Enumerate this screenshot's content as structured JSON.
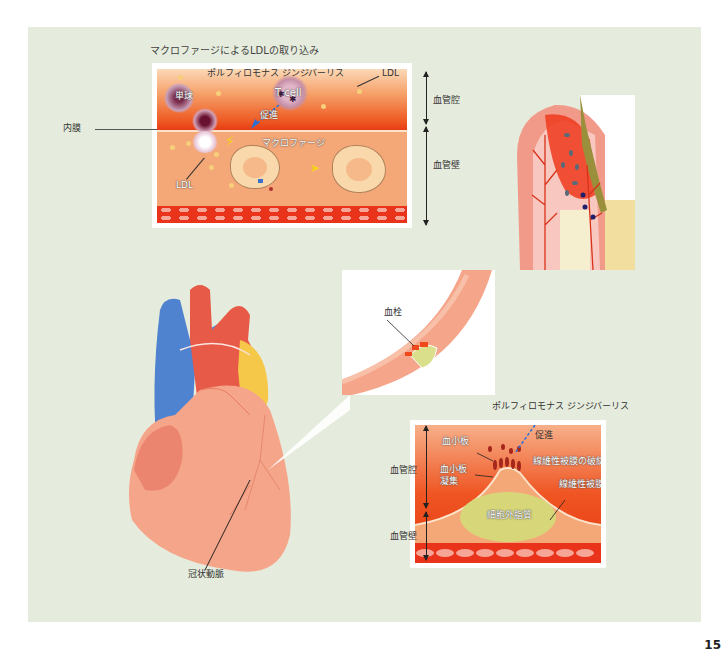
{
  "figure": {
    "background_color": "#e6ecdd",
    "top_panel": {
      "title": "マクロファージによるLDLの取り込み",
      "labels": {
        "bacteria": "ポルフィロモナス ジンジバーリス",
        "ldl_top": "LDL",
        "monocyte": "単球",
        "t_cell": "T cell",
        "promote": "促進",
        "macrophage": "マクロファージ",
        "ldl_bottom": "LDL",
        "intima": "内膜",
        "lumen": "血管腔",
        "wall": "血管壁"
      },
      "colors": {
        "lumen": "#ee5a23",
        "wall": "#f4a777",
        "muscle": "#e9331a"
      }
    },
    "gum_panel": {
      "description": "periodontal tissue inflammation illustration",
      "colors": {
        "gingiva": "#f29a8a",
        "inflamed": "#f03a1c",
        "plaque": "#9a8f3a",
        "tooth": "#f2dfa0"
      }
    },
    "heart_panel": {
      "label_coronary": "冠状動脈",
      "colors": {
        "heart": "#f5a58a",
        "vein": "#4f82cf",
        "aorta": "#e85a48",
        "fat": "#f6c84a"
      }
    },
    "vessel_panel": {
      "label_thrombus": "血栓"
    },
    "plaque_panel": {
      "labels": {
        "bacteria": "ポルフィロモナス ジンジバーリス",
        "promote": "促進",
        "platelet": "血小板",
        "platelet_aggregation_1": "血小板",
        "platelet_aggregation_2": "凝集",
        "fibrous_cap_rupture": "線維性被膜の破綻",
        "fibrous_cap": "線維性被膜",
        "extracellular_lipid": "細胞外脂質",
        "lumen": "血管腔",
        "wall": "血管壁"
      }
    },
    "page_number": "15"
  }
}
